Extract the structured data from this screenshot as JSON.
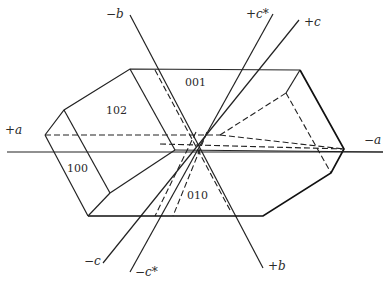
{
  "diagram": {
    "type": "crystal-morphology",
    "axes": {
      "plus_a": "+a",
      "minus_a": "−a",
      "plus_b": "+b",
      "minus_b": "−b",
      "plus_c": "+c",
      "minus_c": "−c",
      "plus_c_star": "+c*",
      "minus_c_star": "−c*"
    },
    "faces": {
      "f001": "001",
      "f102": "102",
      "f100": "100",
      "f010": "010"
    }
  }
}
